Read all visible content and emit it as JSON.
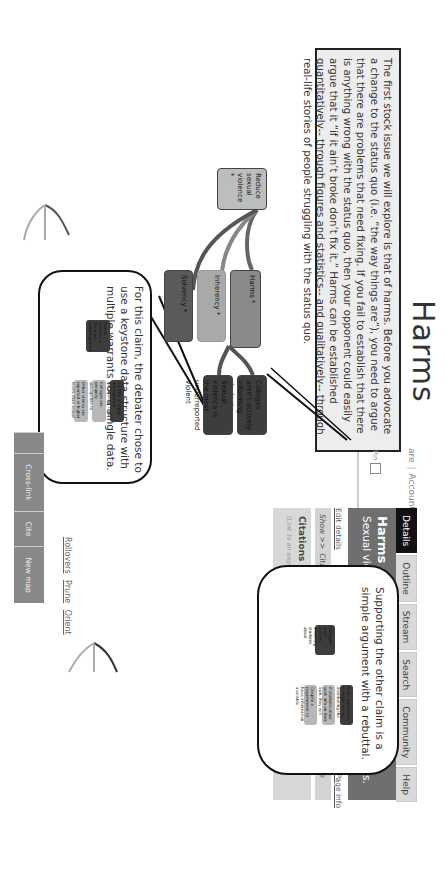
{
  "page": {
    "title": "Harms",
    "intro_text": "The first stock issue we will explore is that of harms. Before you advocate a change to the status quo (i.e. “the way things are”), you need to argue that there are problems that need fixing.  If you fail to establish that there is anything wrong with the status quo, then your opponent could easily argue that it “if it ain’t broke don’t fix it.”  Harms can be established quantitatively-- through figures and statistics-- and qualitatively-- through real-life stories of people struggling with the status quo."
  },
  "sidebar": {
    "account_prefix": "are",
    "account_label": "Account",
    "tabs": [
      {
        "label": "Details",
        "active": true
      },
      {
        "label": "Outline",
        "active": false
      },
      {
        "label": "Stream",
        "active": false
      },
      {
        "label": "Search",
        "active": false
      },
      {
        "label": "Community",
        "active": false
      },
      {
        "label": "Help",
        "active": false
      }
    ],
    "pin_label": "Pin",
    "slider_end_label": "100",
    "node_title": "Harms",
    "node_id": "Harms #266091",
    "node_claim": "Sexual violence is a problem on college campuses.",
    "edit_details": "Edit details",
    "rate_label": "Rate",
    "rate_low": "Low",
    "rate_values": [
      "1",
      "2",
      "3",
      "4",
      "5",
      "6",
      "7",
      "8",
      "9"
    ],
    "rate_high": "High",
    "page_info": "Page info",
    "show_label": "Show >>",
    "radio_options": [
      {
        "label": "Citations⁰",
        "selected": false
      },
      {
        "label": "Comments⁰",
        "selected": true
      },
      {
        "label": "History",
        "selected": false
      },
      {
        "label": "Info",
        "selected": false
      }
    ],
    "hide_label": "<< Hide",
    "citations_title": "Citations",
    "add_citation": "Add new citation",
    "show_all_for_map": "Show all for map",
    "citation_hint": "(Link to an expression of this idea on the web...)"
  },
  "map": {
    "root": "Reduce sexual violence *",
    "stock_issues": [
      "Harms *",
      "Inherency *",
      "Solvency *"
    ],
    "harms_children": [
      "Colleges aren't actively informing students about",
      "Sexual violence is the most underreported violent"
    ],
    "links": [
      "Rollovers",
      "Prune",
      "Orient"
    ],
    "toolbar": [
      "Cross-link",
      "Cite",
      "New map"
    ]
  },
  "callouts": {
    "top_text": "Supporting the other claim is a simple argument with a rebuttal.",
    "top_mini": {
      "claim": "Colleges aren't actively informing students about",
      "children": [
        "From experience colleges are not distributing the",
        "If students must seek info on their own, they will remain",
        "Despite a requirement to have information available"
      ]
    },
    "bottom_text": "For this claim, the debater chose to use a keystone data structure with multiple warrants for a single data.",
    "bottom_mini": {
      "claim": "Sexual violence is the most underreported",
      "children": [
        "14-33% of rapes are reported nationwide. Less than 5% in",
        "Colleges are uniquely susceptible to under reported",
        "Other crimes are reported at higher levels than sexual"
      ]
    }
  },
  "colors": {
    "dark_node": "#3d3d3d",
    "harms_node": "#8a8a8a",
    "inherency_node": "#a9a9a9",
    "solvency_node": "#5a5a5a",
    "root_node": "#bdbdbd",
    "light_node": "#b8b8b8",
    "toolbar": "#888888",
    "active_tab": "#111111"
  }
}
